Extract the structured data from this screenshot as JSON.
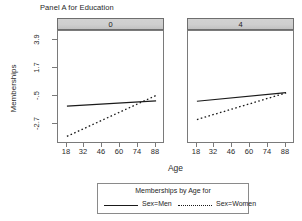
{
  "title": "Panel A for Education",
  "axes": {
    "xlabel": "Age",
    "ylabel": "Memberships",
    "xticks": [
      "18",
      "32",
      "46",
      "60",
      "74",
      "88"
    ],
    "yticks": [
      "3.9",
      "1.7",
      "-.5",
      "-2.7"
    ]
  },
  "panels": [
    {
      "strip_label": "0"
    },
    {
      "strip_label": "4"
    }
  ],
  "legend": {
    "title": "Memberships by Age for",
    "entries": [
      {
        "label": "Sex=Men",
        "style": "solid"
      },
      {
        "label": "Sex=Women",
        "style": "dotted"
      }
    ]
  },
  "colors": {
    "line": "#1a1a1a",
    "strip_fill": "#cfcfcf",
    "panel_border": "#7a7a7a",
    "background": "#ffffff"
  },
  "chart_data": {
    "type": "line",
    "title": "Panel A for Education",
    "xlabel": "Age",
    "ylabel": "Memberships",
    "xlim": [
      11,
      95
    ],
    "ylim": [
      -3.25,
      4.6
    ],
    "xticks": [
      18,
      32,
      46,
      60,
      74,
      88
    ],
    "yticks": [
      3.9,
      1.7,
      -0.5,
      -2.7
    ],
    "grid": false,
    "legend_position": "bottom",
    "legend_title": "Memberships by Age for",
    "facet_variable": "Education",
    "facets": [
      {
        "strip_label": "0",
        "series": [
          {
            "name": "Sex=Men",
            "style": "solid",
            "x": [
              18,
              88
            ],
            "y": [
              -0.62,
              -0.25
            ]
          },
          {
            "name": "Sex=Women",
            "style": "dotted",
            "x": [
              18,
              88
            ],
            "y": [
              -2.72,
              0.12
            ]
          }
        ]
      },
      {
        "strip_label": "4",
        "series": [
          {
            "name": "Sex=Men",
            "style": "solid",
            "x": [
              18,
              88
            ],
            "y": [
              -0.28,
              0.32
            ]
          },
          {
            "name": "Sex=Women",
            "style": "dotted",
            "x": [
              18,
              88
            ],
            "y": [
              -1.55,
              0.3
            ]
          }
        ]
      }
    ]
  }
}
